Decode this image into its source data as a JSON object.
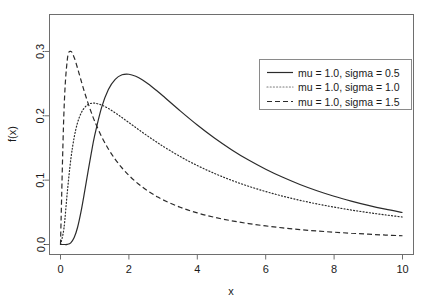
{
  "chart_data": {
    "type": "line",
    "title": "",
    "xlabel": "x",
    "ylabel": "f(x)",
    "xlim": [
      0,
      10
    ],
    "ylim": [
      0,
      0.345
    ],
    "grid": false,
    "legend_position": "top-right",
    "xticks": [
      "0",
      "2",
      "4",
      "6",
      "8",
      "10"
    ],
    "xtick_values": [
      0,
      2,
      4,
      6,
      8,
      10
    ],
    "yticks": [
      "0.0",
      "0.1",
      "0.2",
      "0.3"
    ],
    "ytick_values": [
      0.0,
      0.1,
      0.2,
      0.3
    ],
    "x": [
      0.0,
      0.1,
      0.2,
      0.3,
      0.4,
      0.5,
      0.6,
      0.7,
      0.8,
      0.9,
      1.0,
      1.2,
      1.4,
      1.6,
      1.8,
      2.0,
      2.2,
      2.4,
      2.6,
      2.8,
      3.0,
      3.5,
      4.0,
      4.5,
      5.0,
      5.5,
      6.0,
      6.5,
      7.0,
      7.5,
      8.0,
      8.5,
      9.0,
      9.5,
      10.0
    ],
    "series": [
      {
        "name": "mu = 1.0, sigma = 0.5",
        "linestyle": "solid",
        "color": "#2b2b2b",
        "mu": 1.0,
        "sigma": 0.5,
        "peak_x": 2.12,
        "peak_y": 0.3309,
        "values": [
          0.0,
          0.0,
          0.0002,
          0.0026,
          0.0107,
          0.0268,
          0.051,
          0.0805,
          0.1118,
          0.142,
          0.1694,
          0.2127,
          0.2409,
          0.2567,
          0.2637,
          0.2646,
          0.2614,
          0.2556,
          0.2481,
          0.2396,
          0.2307,
          0.2077,
          0.1857,
          0.1655,
          0.1474,
          0.1312,
          0.117,
          0.1044,
          0.0933,
          0.0836,
          0.075,
          0.0675,
          0.0608,
          0.0549,
          0.0497
        ]
      },
      {
        "name": "mu = 1.0, sigma = 1.0",
        "linestyle": "dotted",
        "color": "#7a7a7a",
        "mu": 1.0,
        "sigma": 1.0,
        "peak_x": 1.0,
        "peak_y": 0.242,
        "values": [
          0.0,
          0.0249,
          0.0819,
          0.1318,
          0.1666,
          0.1895,
          0.2039,
          0.2125,
          0.2173,
          0.2194,
          0.2197,
          0.2168,
          0.2114,
          0.2046,
          0.1972,
          0.1895,
          0.1818,
          0.1741,
          0.1667,
          0.1595,
          0.1526,
          0.1367,
          0.1227,
          0.1105,
          0.0998,
          0.0905,
          0.0823,
          0.0751,
          0.0687,
          0.0631,
          0.0581,
          0.0536,
          0.0496,
          0.046,
          0.0427
        ]
      },
      {
        "name": "mu = 1.0, sigma = 1.5",
        "linestyle": "dashed",
        "color": "#2b2b2b",
        "mu": 1.0,
        "sigma": 1.5,
        "peak_x": 0.29,
        "peak_y": 0.3002,
        "values": [
          0.0,
          0.2049,
          0.2876,
          0.3002,
          0.2905,
          0.2737,
          0.2552,
          0.2372,
          0.2205,
          0.2053,
          0.1915,
          0.1679,
          0.1485,
          0.1324,
          0.1189,
          0.1074,
          0.0976,
          0.089,
          0.0816,
          0.0751,
          0.0693,
          0.0578,
          0.0491,
          0.0423,
          0.0369,
          0.0325,
          0.0289,
          0.0258,
          0.0232,
          0.021,
          0.0191,
          0.0175,
          0.016,
          0.0147,
          0.0136
        ]
      }
    ]
  },
  "axes": {
    "x_label": "x",
    "y_label": "f(x)",
    "x_tick_labels": [
      "0",
      "2",
      "4",
      "6",
      "8",
      "10"
    ],
    "y_tick_labels": [
      "0.0",
      "0.1",
      "0.2",
      "0.3"
    ]
  },
  "legend": {
    "entries": [
      {
        "label": "mu = 1.0, sigma = 0.5",
        "style": "solid"
      },
      {
        "label": "mu = 1.0, sigma = 1.0",
        "style": "dotted"
      },
      {
        "label": "mu = 1.0, sigma = 1.5",
        "style": "dashed"
      }
    ]
  },
  "colors": {
    "background": "#ffffff",
    "frame": "#6e6e6e",
    "text": "#1a1a1a",
    "solid_curve": "#2b2b2b",
    "dotted_curve": "#7a7a7a",
    "dashed_curve": "#2b2b2b",
    "legend_border": "#8a8a8a"
  }
}
